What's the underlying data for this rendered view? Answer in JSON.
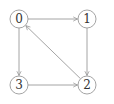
{
  "diagram": {
    "type": "directed-graph",
    "colors": {
      "stroke": "#9a9a9a",
      "node_fill": "#ffffff",
      "label": "#333333",
      "background": "#ffffff"
    },
    "nodes": [
      {
        "id": "0",
        "label": "0",
        "x": 19,
        "y": 19
      },
      {
        "id": "1",
        "label": "1",
        "x": 87,
        "y": 19
      },
      {
        "id": "2",
        "label": "2",
        "x": 87,
        "y": 85
      },
      {
        "id": "3",
        "label": "3",
        "x": 19,
        "y": 85
      }
    ],
    "edges": [
      {
        "from": "0",
        "to": "1"
      },
      {
        "from": "1",
        "to": "2"
      },
      {
        "from": "2",
        "to": "0"
      },
      {
        "from": "0",
        "to": "3"
      },
      {
        "from": "3",
        "to": "2"
      }
    ]
  }
}
